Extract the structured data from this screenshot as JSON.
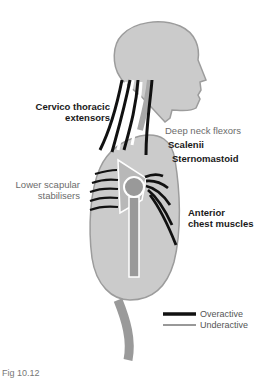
{
  "diagram": {
    "type": "anatomical posture diagram (upper crossed syndrome)",
    "labels": {
      "cervico_thoracic": [
        "Cervico thoracic",
        "extensors"
      ],
      "deep_neck_flexors": "Deep neck flexors",
      "scalenii": "Scalenii",
      "sternomastoid": "Sternomastoid",
      "lower_scapular": [
        "Lower scapular",
        "stabilisers"
      ],
      "anterior_chest": [
        "Anterior",
        "chest muscles"
      ]
    },
    "legend": {
      "overactive": "Overactive",
      "underactive": "Underactive"
    },
    "caption": "Fig 10.12"
  },
  "colors": {
    "body_fill": "#c8c8c8",
    "body_outline": "#9a9a9a",
    "bone_fill": "#999999",
    "overactive_line": "#111111",
    "underactive_line": "#ffffff"
  }
}
